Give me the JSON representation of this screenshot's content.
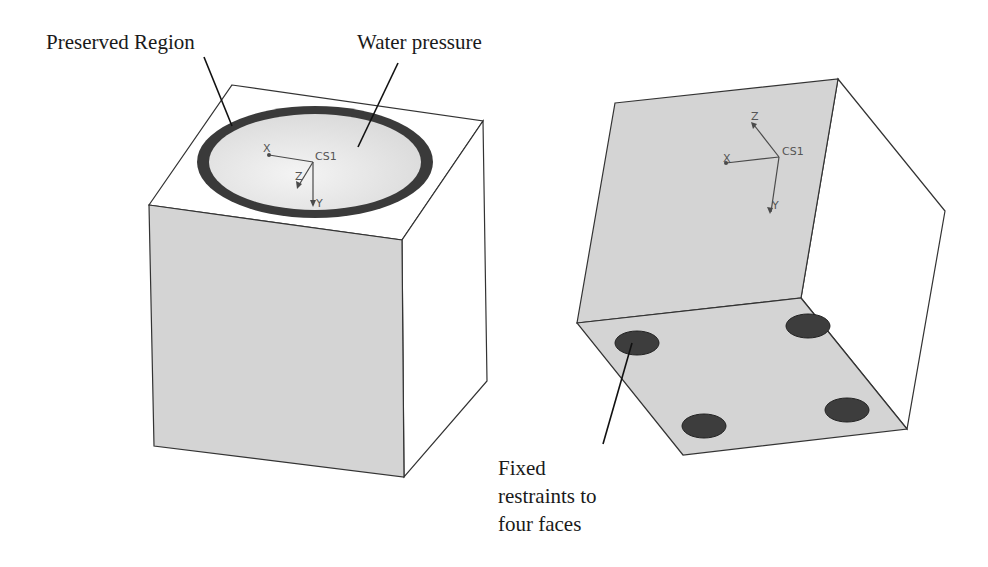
{
  "figure": {
    "left_model": {
      "callouts": {
        "preserved_region": "Preserved Region",
        "water_pressure": "Water pressure"
      },
      "coordinate_system": {
        "name": "CS1",
        "axes": [
          "X",
          "Y",
          "Z"
        ]
      }
    },
    "right_model": {
      "callouts": {
        "fixed_restraints_line1": "Fixed",
        "fixed_restraints_line2": "restraints to",
        "fixed_restraints_line3": "four faces"
      },
      "coordinate_system": {
        "name": "CS1",
        "axes": [
          "X",
          "Y",
          "Z"
        ]
      },
      "restraint_face_count": 4
    },
    "colors": {
      "background": "#ffffff",
      "face_gray": "#d4d4d4",
      "face_white": "#ffffff",
      "bowl_light": "#e4e4e4",
      "preserved_ring": "#3a3a3a",
      "restraint_pad": "#3d3d3d",
      "edge": "#333333"
    }
  }
}
